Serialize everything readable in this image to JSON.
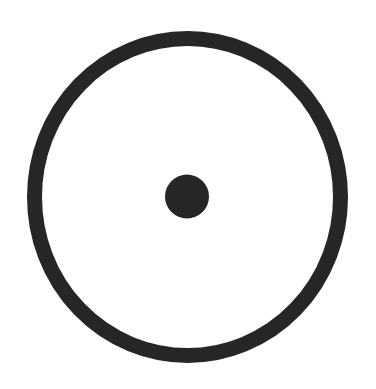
{
  "symbol": {
    "name": "circle-with-center-dot",
    "colors": {
      "foreground": "#262626",
      "background": "#ffffff"
    },
    "outer_ring": {
      "cx": 187.5,
      "cy": 197,
      "rx": 153,
      "ry": 158.5,
      "stroke_width": 15
    },
    "center_dot": {
      "cx": 187,
      "cy": 196.5,
      "r": 22
    }
  }
}
